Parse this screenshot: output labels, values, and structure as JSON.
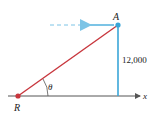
{
  "diagram": {
    "points": {
      "R": {
        "label": "R",
        "x": 18,
        "y": 96
      },
      "A": {
        "label": "A",
        "x": 118,
        "y": 25
      }
    },
    "angle_label": "θ",
    "height_label": "12,000",
    "axis_label": "x",
    "colors": {
      "line_of_sight": "#c8363d",
      "altitude": "#3aa6d8",
      "axis": "#555555",
      "point_R": "#c8363d",
      "point_A": "#3aa6d8"
    }
  }
}
